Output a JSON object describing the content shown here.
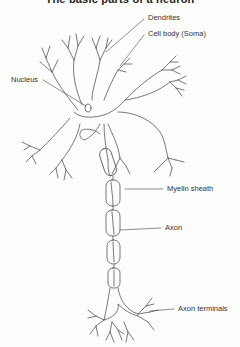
{
  "title": "The basic parts of a neuron",
  "diagram": {
    "subject": "Neuron",
    "stroke_color": "#555555",
    "label_color": "#333333",
    "labels": [
      {
        "id": "dendrites",
        "text": "Dendrites"
      },
      {
        "id": "cell-body",
        "text": "Cell body (Soma)"
      },
      {
        "id": "nucleus",
        "text": "Nucleus"
      },
      {
        "id": "myelin-sheath",
        "text": "Myelin sheath"
      },
      {
        "id": "axon",
        "text": "Axon"
      },
      {
        "id": "axon-terminals",
        "text": "Axon terminals"
      }
    ]
  }
}
